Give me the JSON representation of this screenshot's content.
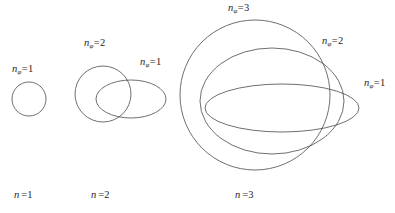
{
  "figure": {
    "background_color": "#ffffff",
    "stroke_color": "#4a4a4a",
    "text_color": "#1f1f1f"
  },
  "symbols": {
    "n": "n",
    "phi_subscript": "φ",
    "equals": "="
  },
  "phi_labels": [
    {
      "id": "n1-phi1",
      "var": "n",
      "sub": "φ",
      "eq": "=",
      "num": "1",
      "x": 12,
      "y": 64
    },
    {
      "id": "n2-phi2",
      "var": "n",
      "sub": "φ",
      "eq": "=",
      "num": "2",
      "x": 84,
      "y": 38
    },
    {
      "id": "n2-phi1",
      "var": "n",
      "sub": "φ",
      "eq": "=",
      "num": "1",
      "x": 140,
      "y": 57
    },
    {
      "id": "n3-phi3",
      "var": "n",
      "sub": "φ",
      "eq": "=",
      "num": "3",
      "x": 228,
      "y": 3
    },
    {
      "id": "n3-phi2",
      "var": "n",
      "sub": "φ",
      "eq": "=",
      "num": "2",
      "x": 322,
      "y": 36
    },
    {
      "id": "n3-phi1",
      "var": "n",
      "sub": "φ",
      "eq": "=",
      "num": "1",
      "x": 364,
      "y": 78
    }
  ],
  "shell_labels": [
    {
      "id": "shell-n1",
      "var": "n",
      "eq": "=",
      "num": "1",
      "x": 14,
      "y": 190
    },
    {
      "id": "shell-n2",
      "var": "n",
      "eq": "=",
      "num": "2",
      "x": 91,
      "y": 190
    },
    {
      "id": "shell-n3",
      "var": "n",
      "eq": "=",
      "num": "3",
      "x": 235,
      "y": 190
    }
  ],
  "curves": [
    {
      "id": "n1-circle",
      "group": "n=1",
      "shape": "circle",
      "cx": 29,
      "cy": 99,
      "rx": 17,
      "ry": 17,
      "rotation": 0
    },
    {
      "id": "n2-circle",
      "group": "n=2",
      "shape": "circle",
      "cx": 103,
      "cy": 94,
      "rx": 28,
      "ry": 28,
      "rotation": 0
    },
    {
      "id": "n2-ellipse",
      "group": "n=2",
      "shape": "ellipse",
      "cx": 131,
      "cy": 99,
      "rx": 35,
      "ry": 19,
      "rotation": 0
    },
    {
      "id": "n3-circle",
      "group": "n=3",
      "shape": "circle",
      "cx": 255,
      "cy": 95,
      "rx": 75,
      "ry": 75,
      "rotation": 0
    },
    {
      "id": "n3-ellipse-mid",
      "group": "n=3",
      "shape": "ellipse",
      "cx": 272,
      "cy": 101,
      "rx": 72,
      "ry": 53,
      "rotation": 0
    },
    {
      "id": "n3-ellipse-in",
      "group": "n=3",
      "shape": "ellipse",
      "cx": 282,
      "cy": 108,
      "rx": 77,
      "ry": 24,
      "rotation": 0
    }
  ],
  "chart_data": {
    "type": "diagram",
    "groups": [
      {
        "n": 1,
        "n_phi_values": [
          1
        ],
        "curve_count": 1
      },
      {
        "n": 2,
        "n_phi_values": [
          2,
          1
        ],
        "curve_count": 2
      },
      {
        "n": 3,
        "n_phi_values": [
          3,
          2,
          1
        ],
        "curve_count": 3
      }
    ]
  }
}
